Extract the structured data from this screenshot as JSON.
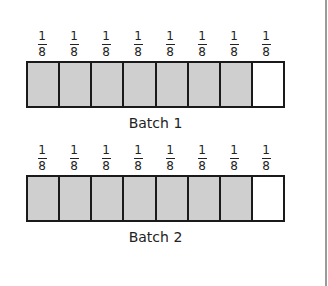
{
  "figure": {
    "batches": [
      {
        "label": "Batch 1",
        "fractions": [
          {
            "num": "1",
            "den": "8"
          },
          {
            "num": "1",
            "den": "8"
          },
          {
            "num": "1",
            "den": "8"
          },
          {
            "num": "1",
            "den": "8"
          },
          {
            "num": "1",
            "den": "8"
          },
          {
            "num": "1",
            "den": "8"
          },
          {
            "num": "1",
            "den": "8"
          },
          {
            "num": "1",
            "den": "8"
          }
        ],
        "cells": [
          "shaded",
          "shaded",
          "shaded",
          "shaded",
          "shaded",
          "shaded",
          "shaded",
          "empty"
        ],
        "shaded_count": 7,
        "total_parts": 8
      },
      {
        "label": "Batch 2",
        "fractions": [
          {
            "num": "1",
            "den": "8"
          },
          {
            "num": "1",
            "den": "8"
          },
          {
            "num": "1",
            "den": "8"
          },
          {
            "num": "1",
            "den": "8"
          },
          {
            "num": "1",
            "den": "8"
          },
          {
            "num": "1",
            "den": "8"
          },
          {
            "num": "1",
            "den": "8"
          },
          {
            "num": "1",
            "den": "8"
          }
        ],
        "cells": [
          "shaded",
          "shaded",
          "shaded",
          "shaded",
          "shaded",
          "shaded",
          "shaded",
          "empty"
        ],
        "shaded_count": 7,
        "total_parts": 8
      }
    ],
    "colors": {
      "shaded": "#cfcfcf",
      "empty": "#ffffff",
      "border": "#1a1a1a"
    }
  }
}
